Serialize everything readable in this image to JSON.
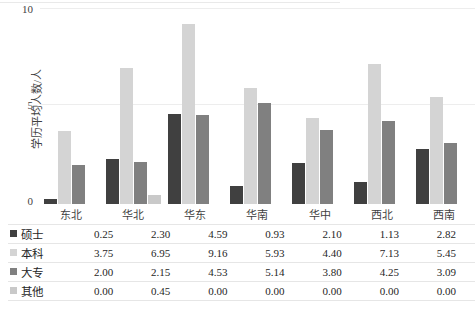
{
  "chart_data": {
    "type": "bar",
    "title": "",
    "xlabel": "",
    "ylabel": "学历平均人数/人",
    "ylim": [
      0,
      10
    ],
    "yticks": [
      0,
      5,
      10
    ],
    "grid": true,
    "legend_position": "table-left",
    "categories": [
      "东北",
      "华北",
      "华东",
      "华南",
      "华中",
      "西北",
      "西南"
    ],
    "series": [
      {
        "name": "硕士",
        "color": "#404040",
        "values": [
          0.25,
          2.3,
          4.59,
          0.93,
          2.1,
          1.13,
          2.82
        ]
      },
      {
        "name": "本科",
        "color": "#d4d4d4",
        "values": [
          3.75,
          6.95,
          9.16,
          5.93,
          4.4,
          7.13,
          5.45
        ]
      },
      {
        "name": "大专",
        "color": "#808080",
        "values": [
          2.0,
          2.15,
          4.53,
          5.14,
          3.8,
          4.25,
          3.09
        ]
      },
      {
        "name": "其他",
        "color": "#c9c9c9",
        "values": [
          0.0,
          0.45,
          0.0,
          0.0,
          0.0,
          0.0,
          0.0
        ]
      }
    ],
    "data_table": {
      "row_labels": [
        "硕士",
        "本科",
        "大专",
        "其他"
      ],
      "column_labels": [
        "东北",
        "华北",
        "华东",
        "华南",
        "华中",
        "西北",
        "西南"
      ],
      "rows": [
        [
          "0.25",
          "2.30",
          "4.59",
          "0.93",
          "2.10",
          "1.13",
          "2.82"
        ],
        [
          "3.75",
          "6.95",
          "9.16",
          "5.93",
          "4.40",
          "7.13",
          "5.45"
        ],
        [
          "2.00",
          "2.15",
          "4.53",
          "5.14",
          "3.80",
          "4.25",
          "3.09"
        ],
        [
          "0.00",
          "0.45",
          "0.00",
          "0.00",
          "0.00",
          "0.00",
          "0.00"
        ]
      ]
    }
  },
  "axis": {
    "y_tick_labels": [
      "10",
      "5",
      "0"
    ]
  }
}
